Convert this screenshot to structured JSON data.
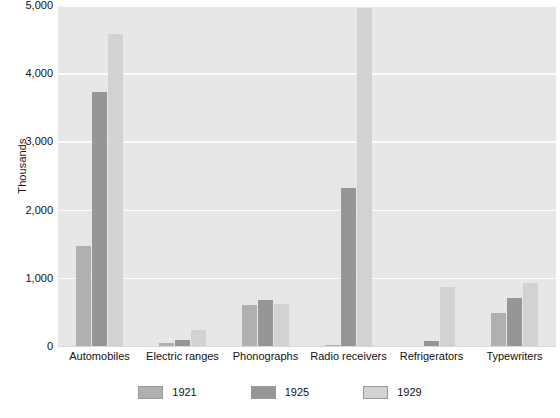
{
  "chart_data": {
    "type": "bar",
    "title": "",
    "subtitle": "",
    "xlabel": "",
    "ylabel": "Thousands",
    "ylim": [
      0,
      5000
    ],
    "yticks": [
      0,
      1000,
      2000,
      3000,
      4000,
      5000
    ],
    "ytick_labels": [
      "0",
      "1,000",
      "2,000",
      "3,000",
      "4,000",
      "5,000"
    ],
    "grid": true,
    "grid_axis": "y",
    "legend_position": "bottom",
    "categories": [
      "Automobiles",
      "Electric ranges",
      "Phonographs",
      "Radio receivers",
      "Refrigerators",
      "Typewriters"
    ],
    "series": [
      {
        "name": "1921",
        "color": "#b0b0b0",
        "values": [
          1460,
          40,
          600,
          10,
          5,
          480
        ]
      },
      {
        "name": "1925",
        "color": "#969696",
        "values": [
          3720,
          95,
          670,
          2320,
          75,
          710
        ]
      },
      {
        "name": "1929",
        "color": "#d2d2d2",
        "values": [
          4580,
          230,
          610,
          4960,
          860,
          930
        ]
      }
    ],
    "plot_background": "#e7e7e7",
    "gridline_color": "#fbfbfb",
    "page_background": "#ffffff"
  }
}
